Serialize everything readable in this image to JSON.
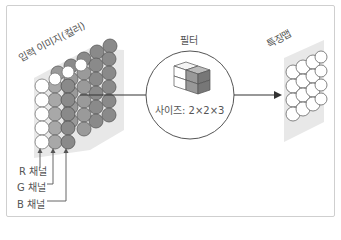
{
  "diagram": {
    "input_label": "입력 이미지(컬러)",
    "filter_label": "필터",
    "filter_size": "사이즈: 2×2×3",
    "feature_map_label": "특징맵",
    "channels": [
      {
        "label": "R 채널"
      },
      {
        "label": "G 채널"
      },
      {
        "label": "B 채널"
      }
    ]
  },
  "colors": {
    "frame_border": "#cfcfcf",
    "r_channel_fill": "#ffffff",
    "g_channel_fill": "#a8a8a8",
    "b_channel_fill": "#888888",
    "panel_bg": "#e6e6e6",
    "line": "#333333",
    "text": "#555555"
  }
}
